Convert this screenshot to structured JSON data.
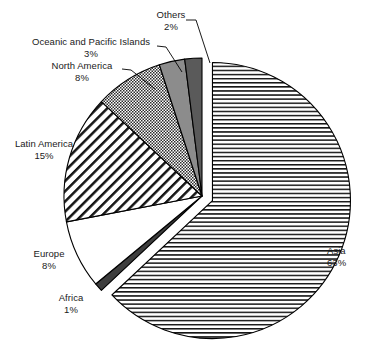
{
  "chart_data": {
    "type": "pie",
    "title": "",
    "subtitle": "",
    "xlabel": "",
    "ylabel": "",
    "legend_position": "none",
    "grid": false,
    "value_unit": "%",
    "start_angle_deg": 0,
    "direction": "clockwise",
    "exploded_slice": "Asia",
    "categories": [
      "Asia",
      "Africa",
      "Europe",
      "Latin America",
      "North America",
      "Oceanic and Pacific Islands",
      "Others"
    ],
    "values": [
      63,
      1,
      8,
      15,
      8,
      3,
      2
    ],
    "slices": [
      {
        "name": "Asia",
        "value": 63,
        "label": "Asia",
        "percent_label": "63%",
        "fill_style": "horizontal-lines",
        "fill_color": "#ffffff",
        "line_color": "#000000",
        "exploded": true,
        "label_align": "left"
      },
      {
        "name": "Africa",
        "value": 1,
        "label": "Africa",
        "percent_label": "1%",
        "fill_style": "solid-dark",
        "fill_color": "#3d3d3d",
        "line_color": "#000000",
        "exploded": false,
        "label_align": "center"
      },
      {
        "name": "Europe",
        "value": 8,
        "label": "Europe",
        "percent_label": "8%",
        "fill_style": "solid-white",
        "fill_color": "#ffffff",
        "line_color": "#000000",
        "exploded": false,
        "label_align": "center"
      },
      {
        "name": "Latin America",
        "value": 15,
        "label": "Latin America",
        "percent_label": "15%",
        "fill_style": "diagonal-hatch",
        "fill_color": "#ffffff",
        "line_color": "#000000",
        "exploded": false,
        "label_align": "center"
      },
      {
        "name": "North America",
        "value": 8,
        "label": "North America",
        "percent_label": "8%",
        "fill_style": "cross-hatch-fine",
        "fill_color": "#ffffff",
        "line_color": "#000000",
        "exploded": false,
        "label_align": "center"
      },
      {
        "name": "Oceanic and Pacific Islands",
        "value": 3,
        "label": "Oceanic and Pacific Islands",
        "percent_label": "3%",
        "fill_style": "solid-gray",
        "fill_color": "#8c8c8c",
        "line_color": "#000000",
        "exploded": false,
        "label_align": "center"
      },
      {
        "name": "Others",
        "value": 2,
        "label": "Others",
        "percent_label": "2%",
        "fill_style": "solid-dark-gray",
        "fill_color": "#5a5a5a",
        "line_color": "#000000",
        "exploded": false,
        "label_align": "center"
      }
    ]
  },
  "colors": {
    "background": "#ffffff",
    "outline": "#000000",
    "text": "#1a1a1a",
    "leader_line": "#000000"
  }
}
